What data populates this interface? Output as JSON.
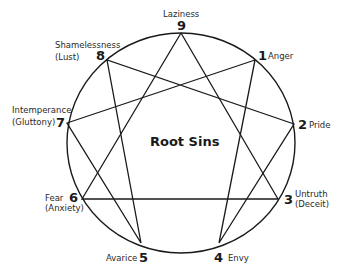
{
  "diagram": {
    "title": "Root Sins",
    "shape": "enneagram",
    "points": [
      {
        "num": "1",
        "label": "Anger",
        "sublabel": ""
      },
      {
        "num": "2",
        "label": "Pride",
        "sublabel": ""
      },
      {
        "num": "3",
        "label": "Untruth",
        "sublabel": "(Deceit)"
      },
      {
        "num": "4",
        "label": "Envy",
        "sublabel": ""
      },
      {
        "num": "5",
        "label": "Avarice",
        "sublabel": ""
      },
      {
        "num": "6",
        "label": "Fear",
        "sublabel": "(Anxiety)"
      },
      {
        "num": "7",
        "label": "Intemperance",
        "sublabel": "(Gluttony)"
      },
      {
        "num": "8",
        "label": "Shamelessness",
        "sublabel": "(Lust)"
      },
      {
        "num": "9",
        "label": "Laziness",
        "sublabel": ""
      }
    ],
    "connections": {
      "triangle": [
        "9",
        "3",
        "6",
        "9"
      ],
      "hexad": [
        "1",
        "4",
        "2",
        "8",
        "5",
        "7",
        "1"
      ]
    }
  }
}
